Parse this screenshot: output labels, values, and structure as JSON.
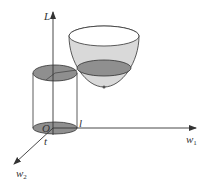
{
  "diagram": {
    "colors": {
      "stroke": "#333333",
      "disk_fill": "#8f8f8f",
      "bowl_fill": "#d9d9d9",
      "background": "#ffffff"
    },
    "axes": {
      "vertical": {
        "label": "L"
      },
      "horizontal": {
        "label": "w",
        "subscript": "1"
      },
      "depth": {
        "label": "w",
        "subscript": "2"
      }
    },
    "labels": {
      "origin": "O",
      "radius_label": "l",
      "depth_label": "t"
    },
    "shapes": {
      "cylinder": "cylinder",
      "paraboloid": "paraboloid"
    }
  }
}
